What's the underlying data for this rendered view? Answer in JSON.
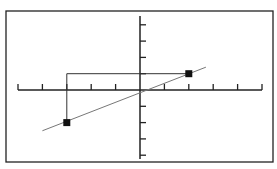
{
  "chart_data": {
    "type": "line",
    "title": "",
    "xlabel": "",
    "ylabel": "",
    "xlim": [
      -5,
      5
    ],
    "ylim": [
      -4,
      4
    ],
    "x_ticks": [
      -5,
      -4,
      -3,
      -2,
      -1,
      1,
      2,
      3,
      4,
      5
    ],
    "y_ticks": [
      -4,
      -3,
      -2,
      -1,
      1,
      2,
      3,
      4
    ],
    "grid": false,
    "legend": null,
    "series": [
      {
        "name": "line",
        "type": "line",
        "x": [
          -4,
          2.7
        ],
        "y": [
          -2.5,
          1.4
        ]
      },
      {
        "name": "points",
        "type": "scatter",
        "marker": "square",
        "x": [
          -3,
          2
        ],
        "y": [
          -2,
          1
        ]
      },
      {
        "name": "guide",
        "type": "line",
        "x": [
          -3,
          -3,
          2
        ],
        "y": [
          -2,
          1,
          1
        ]
      }
    ],
    "colors": {
      "frame": "#222222",
      "axes": "#222222",
      "line": "#777777",
      "points": "#111111"
    }
  }
}
